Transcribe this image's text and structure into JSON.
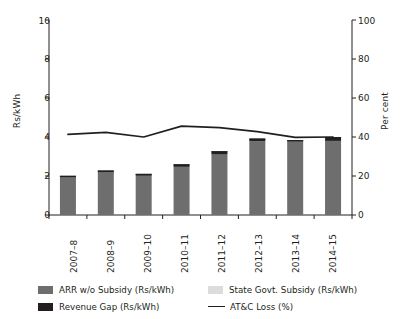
{
  "chart_data": {
    "type": "bar",
    "title": "",
    "subtitle": "",
    "xlabel": "",
    "ylabel": "Rs/kWh",
    "y2label": "Per cent",
    "categories": [
      "2007–8",
      "2008–9",
      "2009–10",
      "2010–11",
      "2011–12",
      "2012–13",
      "2013–14",
      "2014–15"
    ],
    "ylim": [
      0,
      10
    ],
    "yticks": [
      0,
      2,
      4,
      6,
      8,
      10
    ],
    "y2lim": [
      0,
      100
    ],
    "y2ticks": [
      0,
      20,
      40,
      60,
      80,
      100
    ],
    "grid": false,
    "legend_position": "bottom",
    "stacked": true,
    "series": [
      {
        "name": "ARR w/o Subsidy (Rs/kWh)",
        "axis": "left",
        "type": "bar",
        "color": "#6e6e6e",
        "values": [
          1.92,
          2.18,
          2.01,
          2.47,
          3.1,
          3.78,
          3.76,
          3.8
        ]
      },
      {
        "name": "State Govt. Subsidy (Rs/kWh)",
        "axis": "left",
        "type": "bar",
        "color": "#d9d9d9",
        "values": [
          0.0,
          0.0,
          0.0,
          0.0,
          0.0,
          0.0,
          0.0,
          0.0
        ]
      },
      {
        "name": "Revenue Gap (Rs/kWh)",
        "axis": "left",
        "type": "bar",
        "color": "#231f20",
        "values": [
          0.09,
          0.1,
          0.1,
          0.13,
          0.17,
          0.14,
          0.08,
          0.2
        ]
      },
      {
        "name": "AT&C Loss (%)",
        "axis": "right",
        "type": "line",
        "color": "#231f20",
        "values": [
          41.3,
          42.4,
          40.0,
          45.6,
          44.8,
          42.8,
          39.8,
          40.0
        ]
      }
    ],
    "bar_totals": [
      2.01,
      2.28,
      2.11,
      2.6,
      3.27,
      3.92,
      3.84,
      4.0
    ]
  },
  "legend": {
    "items": [
      {
        "label": "ARR w/o Subsidy (Rs/kWh)",
        "marker": "square",
        "color": "#6e6e6e"
      },
      {
        "label": "State Govt. Subsidy (Rs/kWh)",
        "marker": "square",
        "color": "#d9d9d9"
      },
      {
        "label": "Revenue Gap (Rs/kWh)",
        "marker": "square",
        "color": "#231f20"
      },
      {
        "label": "AT&C Loss (%)",
        "marker": "line",
        "color": "#231f20"
      }
    ]
  },
  "axes": {
    "left_ticks": [
      "0",
      "2",
      "4",
      "6",
      "8",
      "10"
    ],
    "right_ticks": [
      "0",
      "20",
      "40",
      "60",
      "80",
      "100"
    ],
    "left_title": "Rs/kWh",
    "right_title": "Per cent"
  }
}
